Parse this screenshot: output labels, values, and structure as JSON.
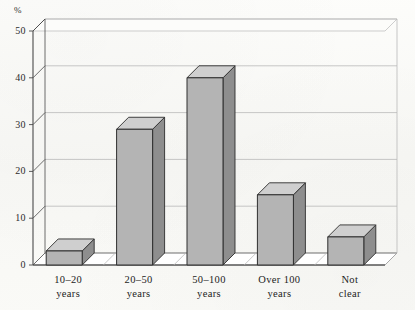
{
  "chart_data": {
    "type": "bar",
    "title": "",
    "subtitle": "",
    "xlabel": "",
    "ylabel": "%",
    "unit_label": "%",
    "categories": [
      "10–20\nyears",
      "20–50\nyears",
      "50–100\nyears",
      "Over 100\nyears",
      "Not\nclear"
    ],
    "category_lines": [
      [
        "10–20",
        "years"
      ],
      [
        "20–50",
        "years"
      ],
      [
        "50–100",
        "years"
      ],
      [
        "Over 100",
        "years"
      ],
      [
        "Not",
        "clear"
      ]
    ],
    "values": [
      3,
      29,
      40,
      15,
      6
    ],
    "ylim": [
      0,
      50
    ],
    "yticks": [
      0,
      10,
      20,
      30,
      40,
      50
    ],
    "ytick_labels": [
      "0",
      "10",
      "20",
      "30",
      "40",
      "50"
    ],
    "grid": true,
    "legend": false,
    "legend_position": "none",
    "style": "3d-bars",
    "colors": {
      "bar_front": "#b4b4b4",
      "bar_top": "#cfcfcf",
      "bar_side": "#8e8e8e",
      "bar_outline": "#2e2e2e",
      "grid": "#b9b9b9",
      "axis": "#4a4a4a",
      "floor": "#ffffff",
      "background": "#fbfbf9",
      "text": "#272727"
    }
  }
}
